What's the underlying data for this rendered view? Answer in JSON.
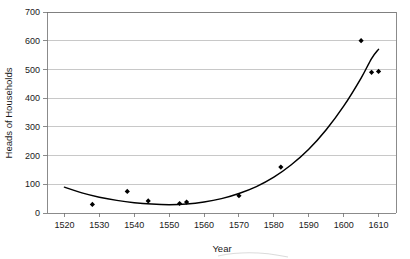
{
  "chart_data": {
    "type": "scatter",
    "title": "",
    "subtitle": "",
    "xlabel": "Year",
    "ylabel": "Heads of Households",
    "xlim": [
      1515,
      1615
    ],
    "ylim": [
      0,
      700
    ],
    "grid": true,
    "grid_axis": "y",
    "legend": false,
    "legend_position": "none",
    "x_ticks": [
      1520,
      1530,
      1540,
      1550,
      1560,
      1570,
      1580,
      1590,
      1600,
      1610
    ],
    "x_tick_labels": [
      "1520",
      "1530",
      "1540",
      "1550",
      "1560",
      "1570",
      "1580",
      "1590",
      "1600",
      "1610"
    ],
    "y_ticks": [
      0,
      100,
      200,
      300,
      400,
      500,
      600,
      700
    ],
    "y_tick_labels": [
      "0",
      "100",
      "200",
      "300",
      "400",
      "500",
      "600",
      "700"
    ],
    "series": [
      {
        "name": "Heads of Households",
        "kind": "scatter",
        "marker": "diamond",
        "color": "#000000",
        "points": [
          {
            "x": 1528,
            "y": 30
          },
          {
            "x": 1538,
            "y": 75
          },
          {
            "x": 1544,
            "y": 42
          },
          {
            "x": 1553,
            "y": 33
          },
          {
            "x": 1555,
            "y": 38
          },
          {
            "x": 1570,
            "y": 60
          },
          {
            "x": 1582,
            "y": 160
          },
          {
            "x": 1605,
            "y": 600
          },
          {
            "x": 1608,
            "y": 490
          },
          {
            "x": 1610,
            "y": 493
          }
        ]
      },
      {
        "name": "Fitted trend curve",
        "kind": "line",
        "color": "#000000",
        "points": [
          {
            "x": 1520,
            "y": 90
          },
          {
            "x": 1525,
            "y": 70
          },
          {
            "x": 1530,
            "y": 55
          },
          {
            "x": 1535,
            "y": 44
          },
          {
            "x": 1540,
            "y": 36
          },
          {
            "x": 1545,
            "y": 31
          },
          {
            "x": 1550,
            "y": 29
          },
          {
            "x": 1555,
            "y": 31
          },
          {
            "x": 1560,
            "y": 38
          },
          {
            "x": 1565,
            "y": 50
          },
          {
            "x": 1570,
            "y": 68
          },
          {
            "x": 1575,
            "y": 92
          },
          {
            "x": 1580,
            "y": 125
          },
          {
            "x": 1585,
            "y": 168
          },
          {
            "x": 1590,
            "y": 222
          },
          {
            "x": 1595,
            "y": 290
          },
          {
            "x": 1600,
            "y": 372
          },
          {
            "x": 1605,
            "y": 470
          },
          {
            "x": 1608,
            "y": 538
          },
          {
            "x": 1610,
            "y": 570
          }
        ]
      }
    ]
  },
  "colors": {
    "marker": "#000000",
    "curve": "#000000",
    "gridline": "#b0b0b0",
    "frame": "#6e6e6e",
    "text": "#1a1a1a",
    "background": "#ffffff"
  }
}
